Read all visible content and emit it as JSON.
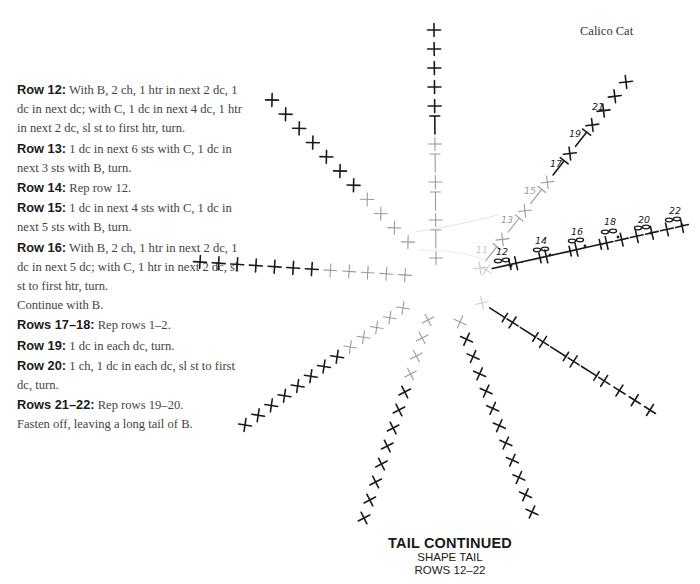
{
  "header": {
    "title": "Calico Cat"
  },
  "instructions": [
    {
      "label": "Row 12:",
      "text": " With B, 2 ch, 1 htr in next 2 dc, 1 dc in next dc; with C, 1 dc in next 4 dc, 1 htr in next 2 dc, sl st to first htr, turn."
    },
    {
      "label": "Row 13:",
      "text": " 1 dc in next 6 sts with C, 1 dc in next 3 sts with B, turn."
    },
    {
      "label": "Row 14:",
      "text": " Rep row 12."
    },
    {
      "label": "Row 15:",
      "text": " 1 dc in next 4 sts with C, 1 dc in next 5 sts with B, turn."
    },
    {
      "label": "Row 16:",
      "text": " With B, 2 ch, 1 htr in next 2 dc, 1 dc in next 5 dc; with C, 1 htr in next 2 dc, sl st to first htr, turn."
    },
    {
      "label": "",
      "text": "Continue with B."
    },
    {
      "label": "Rows 17–18:",
      "text": " Rep rows 1–2."
    },
    {
      "label": "Row 19:",
      "text": " 1 dc in each dc, turn."
    },
    {
      "label": "Row 20:",
      "text": " 1 ch, 1 dc in each dc, sl st to first dc, turn."
    },
    {
      "label": "Rows 21–22:",
      "text": " Rep rows 19–20."
    },
    {
      "label": "",
      "text": "Fasten off, leaving a long tail of B."
    }
  ],
  "caption": {
    "title": "TAIL CONTINUED",
    "subtitle": "SHAPE TAIL",
    "rows": "ROWS 12–22"
  },
  "diagram": {
    "center": [
      458,
      282
    ],
    "colors": {
      "dark": "#1a1a1a",
      "light": "#9a9a9a",
      "faint": "#c8c8c8"
    },
    "spokes": [
      {
        "name": "spoke-up",
        "from": [
          436,
          258
        ],
        "to": [
          434,
          30
        ],
        "count": 13,
        "symbols": [
          "plus",
          "htr",
          "plus",
          "htr",
          "plus",
          "htr",
          "plus",
          "htr",
          "plus",
          "plus",
          "plus",
          "plus",
          "plus"
        ],
        "dark_from": 7
      },
      {
        "name": "spoke-upper-left",
        "from": [
          408,
          242
        ],
        "to": [
          272,
          100
        ],
        "count": 11,
        "symbols": [
          "x"
        ],
        "dark_from": 4
      },
      {
        "name": "spoke-left",
        "from": [
          405,
          275
        ],
        "to": [
          200,
          262
        ],
        "count": 12,
        "symbols": [
          "plus"
        ],
        "dark_from": 5
      },
      {
        "name": "spoke-lower-left",
        "from": [
          403,
          308
        ],
        "to": [
          245,
          425
        ],
        "count": 13,
        "symbols": [
          "x"
        ],
        "dark_from": 5
      },
      {
        "name": "spoke-down-left",
        "from": [
          428,
          320
        ],
        "to": [
          364,
          518
        ],
        "count": 12,
        "symbols": [
          "x"
        ],
        "dark_from": 4
      },
      {
        "name": "spoke-down-right",
        "from": [
          460,
          322
        ],
        "to": [
          532,
          512
        ],
        "count": 12,
        "symbols": [
          "x"
        ],
        "dark_from": 1
      },
      {
        "name": "spoke-right-lower",
        "from": [
          482,
          303
        ],
        "to": [
          650,
          410
        ],
        "count": 12,
        "symbols": [
          "faint-x",
          "htr-r",
          "plus",
          "htr-r",
          "plus",
          "htr-r",
          "plus",
          "htr-r",
          "plus",
          "plus",
          "plus",
          "plus"
        ],
        "dark_from": 1
      },
      {
        "name": "spoke-upper-right",
        "from": [
          480,
          268
        ],
        "to": [
          626,
          82
        ],
        "count": 14,
        "symbols": [
          "faint-x",
          "htr",
          "x",
          "htr",
          "x",
          "htr",
          "x",
          "htr",
          "x",
          "htr",
          "x",
          "x",
          "x",
          "x"
        ],
        "dark_from": 7
      },
      {
        "name": "spoke-right",
        "from": [
          486,
          270
        ],
        "to": [
          682,
          226
        ],
        "count": 14,
        "symbols": [
          "faint-x",
          "htr-b",
          "plus",
          "htr-b",
          "plus",
          "htr-b",
          "plus",
          "htr-b",
          "plus",
          "plus",
          "plus",
          "plus",
          "plus",
          "plus"
        ],
        "dark_from": 1
      }
    ],
    "row_labels": [
      {
        "text": "11",
        "x": 476,
        "y": 253,
        "shade": "faint"
      },
      {
        "text": "12",
        "x": 496,
        "y": 255,
        "shade": "dark"
      },
      {
        "text": "13",
        "x": 501,
        "y": 223,
        "shade": "light"
      },
      {
        "text": "14",
        "x": 535,
        "y": 244,
        "shade": "dark"
      },
      {
        "text": "15",
        "x": 524,
        "y": 194,
        "shade": "light"
      },
      {
        "text": "16",
        "x": 571,
        "y": 235,
        "shade": "dark"
      },
      {
        "text": "17",
        "x": 550,
        "y": 167,
        "shade": "dark"
      },
      {
        "text": "18",
        "x": 604,
        "y": 225,
        "shade": "dark"
      },
      {
        "text": "19",
        "x": 569,
        "y": 137,
        "shade": "dark"
      },
      {
        "text": "20",
        "x": 638,
        "y": 223,
        "shade": "dark"
      },
      {
        "text": "21",
        "x": 592,
        "y": 110,
        "shade": "dark"
      },
      {
        "text": "22",
        "x": 669,
        "y": 214,
        "shade": "dark"
      }
    ],
    "chains": [
      {
        "x": 502,
        "y": 261
      },
      {
        "x": 541,
        "y": 250
      },
      {
        "x": 576,
        "y": 241
      },
      {
        "x": 609,
        "y": 232
      },
      {
        "x": 642,
        "y": 228
      },
      {
        "x": 673,
        "y": 220
      }
    ]
  }
}
